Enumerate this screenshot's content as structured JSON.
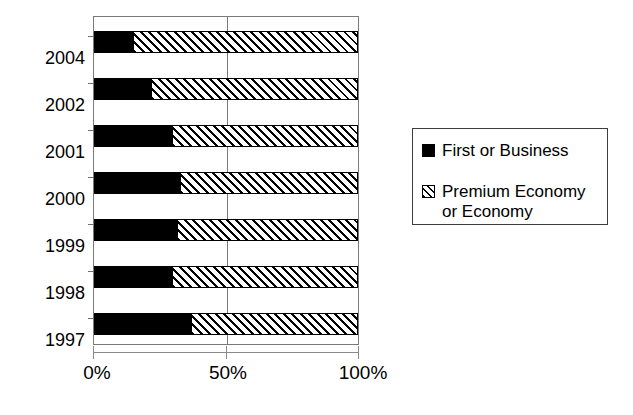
{
  "chart_data": {
    "type": "bar",
    "orientation": "horizontal",
    "stacked": true,
    "normalized": true,
    "title": "",
    "subtitle": "",
    "xlabel": "",
    "ylabel": "",
    "xlim": [
      0,
      100
    ],
    "xticks": [
      0,
      50,
      100
    ],
    "xticklabels": [
      "0%",
      "50%",
      "100%"
    ],
    "grid": "vertical-midline-only",
    "legend_position": "right",
    "categories": [
      "2004",
      "2002",
      "2001",
      "2000",
      "1999",
      "1998",
      "1997"
    ],
    "series": [
      {
        "name": "First or Business",
        "fill": "solid-black",
        "color": "#000000",
        "values": [
          15,
          22,
          30,
          33,
          32,
          30,
          37
        ]
      },
      {
        "name": "Premium Economy or Economy",
        "fill": "diagonal-hatch",
        "color": "#ffffff",
        "values": [
          85,
          78,
          70,
          67,
          68,
          70,
          63
        ]
      }
    ]
  },
  "legend": {
    "entries": [
      {
        "label": "First or Business",
        "swatch": "solid-black-swatch"
      },
      {
        "label": "Premium Economy\nor Economy",
        "swatch": "hatched-swatch"
      }
    ]
  },
  "axis": {
    "x_tick_labels": [
      "0%",
      "50%",
      "100%"
    ],
    "y_tick_labels": [
      "2004",
      "2002",
      "2001",
      "2000",
      "1999",
      "1998",
      "1997"
    ]
  },
  "colors": {
    "series_first": "#000000",
    "series_economy": "#ffffff",
    "axis": "#7a7a7a",
    "background": "#ffffff"
  }
}
